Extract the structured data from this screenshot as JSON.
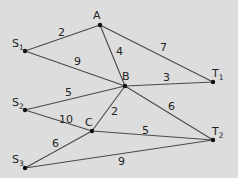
{
  "diagram": {
    "background": "#dddddd",
    "nodes": [
      {
        "id": "A",
        "label": "A",
        "sub": "",
        "x": 100,
        "y": 25,
        "lx": 93,
        "ly": 19
      },
      {
        "id": "S1",
        "label": "S",
        "sub": "1",
        "x": 25,
        "y": 51,
        "lx": 12,
        "ly": 47
      },
      {
        "id": "B",
        "label": "B",
        "sub": "",
        "x": 125,
        "y": 86,
        "lx": 122,
        "ly": 80
      },
      {
        "id": "T1",
        "label": "T",
        "sub": "1",
        "x": 213,
        "y": 82,
        "lx": 212,
        "ly": 77
      },
      {
        "id": "S2",
        "label": "S",
        "sub": "2",
        "x": 25,
        "y": 110,
        "lx": 12,
        "ly": 106
      },
      {
        "id": "C",
        "label": "C",
        "sub": "",
        "x": 92,
        "y": 131,
        "lx": 85,
        "ly": 126
      },
      {
        "id": "T2",
        "label": "T",
        "sub": "2",
        "x": 213,
        "y": 140,
        "lx": 212,
        "ly": 135
      },
      {
        "id": "S3",
        "label": "S",
        "sub": "3",
        "x": 25,
        "y": 168,
        "lx": 12,
        "ly": 163
      }
    ],
    "edges": [
      {
        "from": "S1",
        "to": "A",
        "weight": "2",
        "lx": 58,
        "ly": 36
      },
      {
        "from": "S1",
        "to": "B",
        "weight": "9",
        "lx": 74,
        "ly": 65
      },
      {
        "from": "A",
        "to": "B",
        "weight": "4",
        "lx": 116,
        "ly": 55
      },
      {
        "from": "A",
        "to": "T1",
        "weight": "7",
        "lx": 160,
        "ly": 51
      },
      {
        "from": "B",
        "to": "T1",
        "weight": "3",
        "lx": 163,
        "ly": 81
      },
      {
        "from": "S2",
        "to": "B",
        "weight": "5",
        "lx": 65,
        "ly": 96
      },
      {
        "from": "S2",
        "to": "C",
        "weight": "10",
        "lx": 59,
        "ly": 123
      },
      {
        "from": "C",
        "to": "B",
        "weight": "2",
        "lx": 111,
        "ly": 115
      },
      {
        "from": "B",
        "to": "T2",
        "weight": "6",
        "lx": 168,
        "ly": 110
      },
      {
        "from": "C",
        "to": "T2",
        "weight": "5",
        "lx": 142,
        "ly": 134
      },
      {
        "from": "S3",
        "to": "C",
        "weight": "6",
        "lx": 52,
        "ly": 147
      },
      {
        "from": "S3",
        "to": "T2",
        "weight": "9",
        "lx": 118,
        "ly": 165
      }
    ]
  }
}
